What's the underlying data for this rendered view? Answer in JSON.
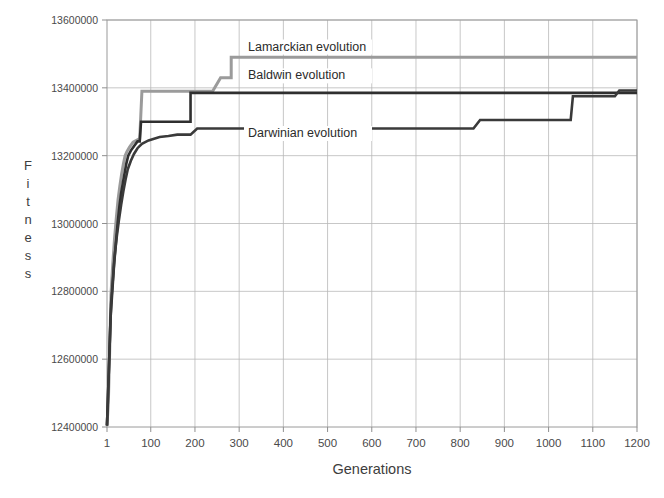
{
  "chart_data": {
    "type": "line",
    "title": "",
    "xlabel": "Generations",
    "ylabel": "Fitness",
    "xlim": [
      1,
      1200
    ],
    "ylim": [
      12400000,
      13600000
    ],
    "grid": true,
    "legend_position": "inline-annotations",
    "xticks": [
      1,
      100,
      200,
      300,
      400,
      500,
      600,
      700,
      800,
      900,
      1000,
      1100,
      1200
    ],
    "xtick_labels": [
      "1",
      "100",
      "200",
      "300",
      "400",
      "500",
      "600",
      "700",
      "800",
      "900",
      "1000",
      "1100",
      "1200"
    ],
    "yticks": [
      12400000,
      12600000,
      12800000,
      13000000,
      13200000,
      13400000,
      13600000
    ],
    "ytick_labels": [
      "12400000",
      "12600000",
      "12800000",
      "13000000",
      "13200000",
      "13400000",
      "13600000"
    ],
    "series": [
      {
        "name": "Lamarckian evolution",
        "color": "#9b9b9b",
        "stroke_width": 3.0,
        "label_x": 1200,
        "label_y": 13490000,
        "points": [
          [
            1,
            12405000
          ],
          [
            4,
            12470000
          ],
          [
            7,
            12620000
          ],
          [
            10,
            12790000
          ],
          [
            14,
            12880000
          ],
          [
            18,
            12955000
          ],
          [
            22,
            13015000
          ],
          [
            26,
            13070000
          ],
          [
            30,
            13110000
          ],
          [
            34,
            13145000
          ],
          [
            38,
            13175000
          ],
          [
            42,
            13200000
          ],
          [
            46,
            13212000
          ],
          [
            52,
            13225000
          ],
          [
            60,
            13240000
          ],
          [
            75,
            13250000
          ],
          [
            80,
            13390000
          ],
          [
            240,
            13390000
          ],
          [
            258,
            13430000
          ],
          [
            282,
            13430000
          ],
          [
            282,
            13490000
          ],
          [
            1200,
            13490000
          ]
        ]
      },
      {
        "name": "Baldwin evolution",
        "color": "#2f2f2f",
        "stroke_width": 2.6,
        "label_x": 1200,
        "label_y": 13390000,
        "points": [
          [
            1,
            12404000
          ],
          [
            5,
            12560000
          ],
          [
            9,
            12720000
          ],
          [
            13,
            12800000
          ],
          [
            17,
            12878000
          ],
          [
            21,
            12940000
          ],
          [
            25,
            13000000
          ],
          [
            29,
            13050000
          ],
          [
            33,
            13090000
          ],
          [
            37,
            13120000
          ],
          [
            41,
            13150000
          ],
          [
            45,
            13178000
          ],
          [
            49,
            13200000
          ],
          [
            55,
            13215000
          ],
          [
            62,
            13228000
          ],
          [
            70,
            13242000
          ],
          [
            75,
            13242000
          ],
          [
            78,
            13300000
          ],
          [
            190,
            13300000
          ],
          [
            190,
            13385000
          ],
          [
            1200,
            13385000
          ]
        ]
      },
      {
        "name": "Darwinian evolution",
        "color": "#3a3a3a",
        "stroke_width": 2.6,
        "label_x": 1200,
        "label_y": 13310000,
        "points": [
          [
            1,
            12404000
          ],
          [
            6,
            12600000
          ],
          [
            10,
            12760000
          ],
          [
            14,
            12830000
          ],
          [
            18,
            12900000
          ],
          [
            23,
            12960000
          ],
          [
            28,
            13010000
          ],
          [
            33,
            13055000
          ],
          [
            38,
            13095000
          ],
          [
            43,
            13130000
          ],
          [
            48,
            13160000
          ],
          [
            55,
            13185000
          ],
          [
            62,
            13205000
          ],
          [
            70,
            13222000
          ],
          [
            80,
            13235000
          ],
          [
            95,
            13245000
          ],
          [
            120,
            13255000
          ],
          [
            140,
            13258000
          ],
          [
            160,
            13262000
          ],
          [
            190,
            13262000
          ],
          [
            205,
            13280000
          ],
          [
            830,
            13280000
          ],
          [
            845,
            13305000
          ],
          [
            1050,
            13305000
          ],
          [
            1055,
            13375000
          ],
          [
            1150,
            13375000
          ],
          [
            1160,
            13392000
          ],
          [
            1200,
            13392000
          ]
        ]
      }
    ],
    "annotations": [
      {
        "text": "Lamarckian evolution",
        "x": 320,
        "y": 13510000,
        "series": "Lamarckian evolution"
      },
      {
        "text": "Baldwin evolution",
        "x": 320,
        "y": 13425000,
        "series": "Baldwin evolution"
      },
      {
        "text": "Darwinian evolution",
        "x": 320,
        "y": 13255000,
        "series": "Darwinian evolution"
      }
    ]
  }
}
